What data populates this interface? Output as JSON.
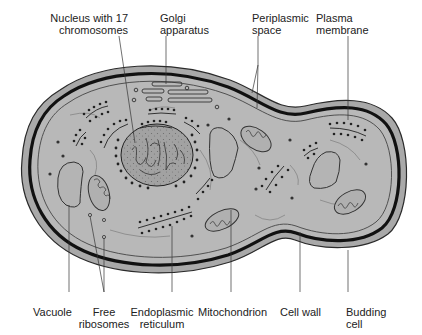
{
  "figure": {
    "colors": {
      "background": "#ffffff",
      "cytoplasm": "#b8b8b8",
      "periplasm": "#a9a9a9",
      "cell_wall": "#111111",
      "nucleus_fill": "#9a9a9a",
      "outline": "#2a2a2a",
      "label_text": "#222222"
    }
  },
  "labels": {
    "nucleus": "Nucleus with 17\nchromosomes",
    "golgi": "Golgi\napparatus",
    "periplasmic": "Periplasmic\nspace",
    "plasma_membrane": "Plasma\nmembrane",
    "vacuole": "Vacuole",
    "free_ribosomes": "Free\nribosomes",
    "er": "Endoplasmic\nreticulum",
    "mitochondrion": "Mitochondrion",
    "cell_wall": "Cell wall",
    "budding_cell": "Budding\ncell"
  }
}
